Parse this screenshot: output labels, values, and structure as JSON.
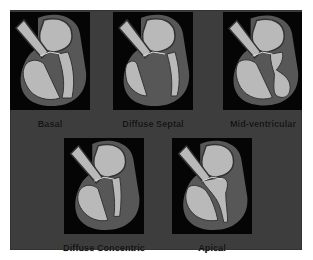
{
  "figure": {
    "title": "",
    "panels": [
      {
        "id": "basal",
        "label": "Basal"
      },
      {
        "id": "diffuse-septal",
        "label": "Diffuse Septal"
      },
      {
        "id": "mid-ventricular",
        "label": "Mid-ventricular"
      },
      {
        "id": "diffuse-concentric",
        "label": "Diffuse Concentric"
      },
      {
        "id": "apical",
        "label": "Apical"
      }
    ]
  },
  "colors": {
    "background": "#3d3d3d",
    "panel": "#050505",
    "myocardium": "#575757",
    "chamber": "#b9b9b9",
    "label": "#111111"
  }
}
